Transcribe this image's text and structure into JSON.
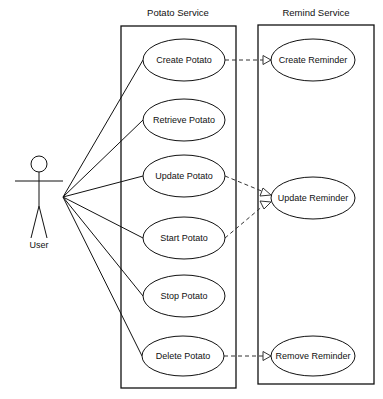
{
  "actor": {
    "label": "User",
    "x": 39,
    "y": 164
  },
  "systems": [
    {
      "id": "potato",
      "title": "Potato Service",
      "x": 121,
      "y": 26,
      "w": 115,
      "h": 362
    },
    {
      "id": "remind",
      "title": "Remind Service",
      "x": 258,
      "y": 25,
      "w": 116,
      "h": 359
    }
  ],
  "use_cases": [
    {
      "id": "create_potato",
      "label": "Create Potato",
      "cx": 184,
      "cy": 60,
      "rx": 41,
      "ry": 21
    },
    {
      "id": "retrieve_potato",
      "label": "Retrieve Potato",
      "cx": 184,
      "cy": 120,
      "rx": 41,
      "ry": 21
    },
    {
      "id": "update_potato",
      "label": "Update Potato",
      "cx": 184,
      "cy": 176,
      "rx": 41,
      "ry": 21
    },
    {
      "id": "start_potato",
      "label": "Start Potato",
      "cx": 184,
      "cy": 238,
      "rx": 41,
      "ry": 21
    },
    {
      "id": "stop_potato",
      "label": "Stop Potato",
      "cx": 184,
      "cy": 296,
      "rx": 41,
      "ry": 21
    },
    {
      "id": "delete_potato",
      "label": "Delete Potato",
      "cx": 183,
      "cy": 356,
      "rx": 41,
      "ry": 20
    },
    {
      "id": "create_reminder",
      "label": "Create Reminder",
      "cx": 313,
      "cy": 60,
      "rx": 42,
      "ry": 21
    },
    {
      "id": "update_reminder",
      "label": "Update Reminder",
      "cx": 313,
      "cy": 198,
      "rx": 42,
      "ry": 21
    },
    {
      "id": "remove_reminder",
      "label": "Remove Reminder",
      "cx": 313,
      "cy": 356,
      "rx": 42,
      "ry": 20
    }
  ],
  "associations": [
    "create_potato",
    "retrieve_potato",
    "update_potato",
    "start_potato",
    "stop_potato",
    "delete_potato"
  ],
  "dependencies": [
    {
      "from": "create_potato",
      "to": "create_reminder"
    },
    {
      "from": "update_potato",
      "to": "update_reminder"
    },
    {
      "from": "start_potato",
      "to": "update_reminder"
    },
    {
      "from": "delete_potato",
      "to": "remove_reminder"
    }
  ]
}
